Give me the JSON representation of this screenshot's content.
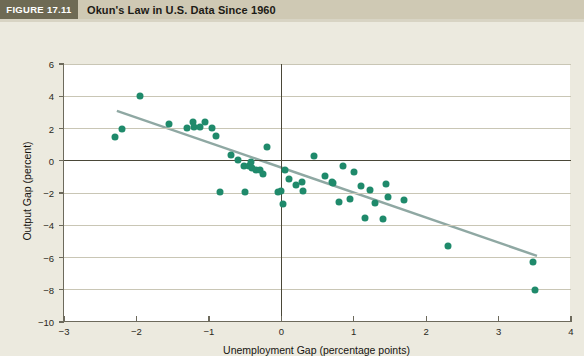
{
  "header": {
    "figure_tag": "FIGURE 17.11",
    "title": "Okun's Law in U.S. Data Since 1960"
  },
  "colors": {
    "tag_background": "#6e6a54",
    "band_background": "#cfc9b4",
    "paper_background": "#eceadf",
    "plot_background": "#ffffff",
    "point_color": "#1f8a6b",
    "trendline_color": "#8fa8a3",
    "gridline_color": "#c9c6b5",
    "axis_color": "#4a4838"
  },
  "chart_data": {
    "type": "scatter",
    "title": "Okun's Law in U.S. Data Since 1960",
    "xlabel": "Unemployment Gap (percentage points)",
    "ylabel": "Output Gap (percent)",
    "xlim": [
      -3,
      4
    ],
    "ylim": [
      -10,
      6
    ],
    "xticks": [
      -3,
      -2,
      -1,
      0,
      1,
      2,
      3,
      4
    ],
    "xtick_labels": [
      "−3",
      "−2",
      "−1",
      "0",
      "1",
      "2",
      "3",
      "4"
    ],
    "yticks": [
      -10,
      -8,
      -6,
      -4,
      -2,
      0,
      2,
      4,
      6
    ],
    "ytick_labels": [
      "−10",
      "−8",
      "−6",
      "−4",
      "−2",
      "0",
      "2",
      "4",
      "6"
    ],
    "grid": "horizontal",
    "legend": null,
    "series": [
      {
        "name": "U.S. annual observations since 1960",
        "marker": "circle",
        "color": "#1f8a6b",
        "points": [
          [
            -2.3,
            1.45
          ],
          [
            -2.2,
            1.95
          ],
          [
            -1.95,
            4.0
          ],
          [
            -1.55,
            2.3
          ],
          [
            -1.3,
            2.05
          ],
          [
            -1.22,
            2.4
          ],
          [
            -1.2,
            2.1
          ],
          [
            -1.12,
            2.1
          ],
          [
            -1.05,
            2.4
          ],
          [
            -0.95,
            2.05
          ],
          [
            -0.9,
            1.55
          ],
          [
            -0.85,
            -1.95
          ],
          [
            -0.7,
            0.35
          ],
          [
            -0.6,
            0.05
          ],
          [
            -0.52,
            -0.35
          ],
          [
            -0.5,
            -1.95
          ],
          [
            -0.45,
            -0.3
          ],
          [
            -0.42,
            -0.05
          ],
          [
            -0.4,
            -0.45
          ],
          [
            -0.35,
            -0.55
          ],
          [
            -0.3,
            -0.55
          ],
          [
            -0.25,
            -0.85
          ],
          [
            -0.2,
            0.85
          ],
          [
            -0.05,
            -1.95
          ],
          [
            0.0,
            -1.9
          ],
          [
            0.02,
            -2.7
          ],
          [
            0.05,
            -0.6
          ],
          [
            0.1,
            -1.15
          ],
          [
            0.2,
            -1.5
          ],
          [
            0.28,
            -1.3
          ],
          [
            0.3,
            -1.9
          ],
          [
            0.45,
            0.3
          ],
          [
            0.6,
            -0.95
          ],
          [
            0.7,
            -1.3
          ],
          [
            0.72,
            -1.35
          ],
          [
            0.8,
            -2.55
          ],
          [
            0.85,
            -0.35
          ],
          [
            0.95,
            -2.35
          ],
          [
            1.0,
            -0.7
          ],
          [
            1.1,
            -1.55
          ],
          [
            1.15,
            -3.55
          ],
          [
            1.22,
            -1.8
          ],
          [
            1.3,
            -2.6
          ],
          [
            1.4,
            -3.6
          ],
          [
            1.45,
            -1.45
          ],
          [
            1.48,
            -2.25
          ],
          [
            1.7,
            -2.45
          ],
          [
            2.3,
            -5.3
          ],
          [
            3.48,
            -6.3
          ],
          [
            3.5,
            -8.0
          ]
        ]
      }
    ],
    "trendline": {
      "name": "fitted Okun's Law line",
      "color": "#8fa8a3",
      "x_start": -2.27,
      "y_start": 3.1,
      "x_end": 3.53,
      "y_end": -5.9
    }
  }
}
